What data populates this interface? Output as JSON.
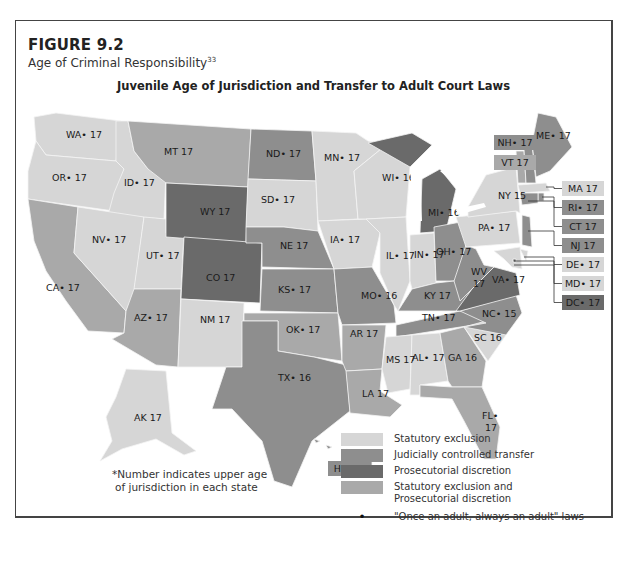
{
  "figure": {
    "number": "FIGURE 9.2",
    "subtitle": "Age of Criminal Responsibility",
    "footnote_ref": "33",
    "map_title": "Juvenile Age of Jurisdiction and Transfer to Adult Court Laws",
    "note_line1": "*Number indicates upper age",
    "note_line2": "of jurisdiction in each state"
  },
  "categories": {
    "statutory": {
      "label": "Statutory exclusion",
      "color": "#d6d6d6"
    },
    "judicial": {
      "label": "Judicially controlled transfer",
      "color": "#8e8e8e"
    },
    "prosecutorial": {
      "label": "Prosecutorial discretion",
      "color": "#6a6a6a"
    },
    "both": {
      "label_line1": "Statutory exclusion and",
      "label_line2": "Prosecutorial discretion",
      "color": "#a9a9a9"
    }
  },
  "legend": {
    "dot_symbol": "•",
    "dot_label": "\"Once an adult, always an adult\" laws"
  },
  "states": [
    {
      "abbr": "WA",
      "age": 17,
      "dot": true,
      "cat": "statutory"
    },
    {
      "abbr": "OR",
      "age": 17,
      "dot": true,
      "cat": "statutory"
    },
    {
      "abbr": "CA",
      "age": 17,
      "dot": true,
      "cat": "both"
    },
    {
      "abbr": "ID",
      "age": 17,
      "dot": true,
      "cat": "statutory"
    },
    {
      "abbr": "NV",
      "age": 17,
      "dot": true,
      "cat": "statutory"
    },
    {
      "abbr": "UT",
      "age": 17,
      "dot": true,
      "cat": "statutory"
    },
    {
      "abbr": "AZ",
      "age": 17,
      "dot": true,
      "cat": "both"
    },
    {
      "abbr": "MT",
      "age": 17,
      "dot": false,
      "cat": "both"
    },
    {
      "abbr": "WY",
      "age": 17,
      "dot": false,
      "cat": "prosecutorial"
    },
    {
      "abbr": "CO",
      "age": 17,
      "dot": false,
      "cat": "prosecutorial"
    },
    {
      "abbr": "NM",
      "age": 17,
      "dot": false,
      "cat": "statutory"
    },
    {
      "abbr": "ND",
      "age": 17,
      "dot": true,
      "cat": "judicial"
    },
    {
      "abbr": "SD",
      "age": 17,
      "dot": true,
      "cat": "statutory"
    },
    {
      "abbr": "NE",
      "age": 17,
      "dot": false,
      "cat": "judicial"
    },
    {
      "abbr": "KS",
      "age": 17,
      "dot": true,
      "cat": "judicial"
    },
    {
      "abbr": "OK",
      "age": 17,
      "dot": true,
      "cat": "both"
    },
    {
      "abbr": "TX",
      "age": 16,
      "dot": true,
      "cat": "judicial"
    },
    {
      "abbr": "MN",
      "age": 17,
      "dot": true,
      "cat": "statutory"
    },
    {
      "abbr": "IA",
      "age": 17,
      "dot": true,
      "cat": "statutory"
    },
    {
      "abbr": "MO",
      "age": 16,
      "dot": true,
      "cat": "judicial"
    },
    {
      "abbr": "AR",
      "age": 17,
      "dot": false,
      "cat": "both"
    },
    {
      "abbr": "LA",
      "age": 17,
      "dot": false,
      "cat": "both"
    },
    {
      "abbr": "WI",
      "age": 16,
      "dot": true,
      "cat": "statutory"
    },
    {
      "abbr": "IL",
      "age": 17,
      "dot": true,
      "cat": "statutory"
    },
    {
      "abbr": "MI",
      "age": 16,
      "dot": true,
      "cat": "prosecutorial"
    },
    {
      "abbr": "IN",
      "age": 17,
      "dot": true,
      "cat": "statutory"
    },
    {
      "abbr": "OH",
      "age": 17,
      "dot": true,
      "cat": "judicial"
    },
    {
      "abbr": "KY",
      "age": 17,
      "dot": false,
      "cat": "judicial"
    },
    {
      "abbr": "TN",
      "age": 17,
      "dot": true,
      "cat": "judicial"
    },
    {
      "abbr": "MS",
      "age": 17,
      "dot": false,
      "cat": "statutory"
    },
    {
      "abbr": "AL",
      "age": 17,
      "dot": true,
      "cat": "statutory"
    },
    {
      "abbr": "GA",
      "age": 16,
      "dot": false,
      "cat": "both"
    },
    {
      "abbr": "FL",
      "age": 17,
      "dot": true,
      "cat": "both"
    },
    {
      "abbr": "SC",
      "age": 16,
      "dot": false,
      "cat": "statutory"
    },
    {
      "abbr": "NC",
      "age": 15,
      "dot": true,
      "cat": "judicial"
    },
    {
      "abbr": "VA",
      "age": 17,
      "dot": true,
      "cat": "prosecutorial"
    },
    {
      "abbr": "WV",
      "age": 17,
      "dot": false,
      "cat": "judicial"
    },
    {
      "abbr": "PA",
      "age": 17,
      "dot": true,
      "cat": "statutory"
    },
    {
      "abbr": "NY",
      "age": 15,
      "dot": false,
      "cat": "statutory"
    },
    {
      "abbr": "VT",
      "age": 17,
      "dot": false,
      "cat": "both"
    },
    {
      "abbr": "NH",
      "age": 17,
      "dot": true,
      "cat": "judicial"
    },
    {
      "abbr": "ME",
      "age": 17,
      "dot": true,
      "cat": "judicial"
    },
    {
      "abbr": "MA",
      "age": 17,
      "dot": false,
      "cat": "statutory"
    },
    {
      "abbr": "RI",
      "age": 17,
      "dot": true,
      "cat": "judicial"
    },
    {
      "abbr": "CT",
      "age": 17,
      "dot": false,
      "cat": "judicial"
    },
    {
      "abbr": "NJ",
      "age": 17,
      "dot": false,
      "cat": "judicial"
    },
    {
      "abbr": "DE",
      "age": 17,
      "dot": true,
      "cat": "statutory"
    },
    {
      "abbr": "MD",
      "age": 17,
      "dot": true,
      "cat": "statutory"
    },
    {
      "abbr": "DC",
      "age": 17,
      "dot": true,
      "cat": "prosecutorial"
    },
    {
      "abbr": "AK",
      "age": 17,
      "dot": false,
      "cat": "statutory"
    },
    {
      "abbr": "HI",
      "age": 17,
      "dot": true,
      "cat": "judicial"
    }
  ]
}
